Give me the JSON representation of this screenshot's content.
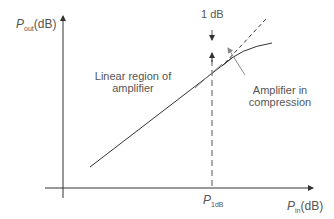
{
  "diagram": {
    "y_axis": {
      "symbol": "P",
      "subscript": "out",
      "unit": "(dB)"
    },
    "x_axis": {
      "symbol": "P",
      "subscript": "in",
      "unit": "(dB)"
    },
    "marker": {
      "symbol": "P",
      "subscript": "1dB"
    },
    "annotations": {
      "compression_gap": "1 dB",
      "linear_line1": "Linear region of",
      "linear_line2": "amplifier",
      "compression_line1": "Amplifier in",
      "compression_line2": "compression"
    },
    "colors": {
      "line": "#333333",
      "text": "#555555",
      "pointer": "#888888"
    }
  }
}
